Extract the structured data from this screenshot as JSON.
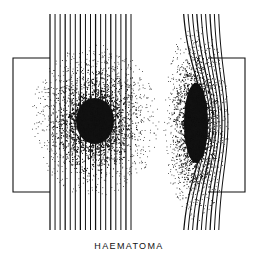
{
  "figure": {
    "caption": "HAEMATOMA",
    "background_color": "#ffffff",
    "ink_color": "#111111",
    "width": 258,
    "height": 266,
    "panels": [
      {
        "id": "left-panel",
        "name": "undisplaced-layers",
        "line_count": 17,
        "line_x_start": 50,
        "line_x_end": 131,
        "line_y_top": 14,
        "line_y_bottom": 231,
        "curvature": 0,
        "lesion": {
          "name": "haematoma-round",
          "shape": "circle",
          "center_x": 95,
          "center_y": 121,
          "core_radius_x": 19,
          "core_radius_y": 23,
          "halo_radius_x": 37,
          "halo_radius_y": 44,
          "stipple_points": 2600
        },
        "bracket": {
          "name": "left-bracket",
          "orientation": "left",
          "x_spine": 13,
          "x_arm_end": 50,
          "y_top": 58,
          "y_bottom": 192
        }
      },
      {
        "id": "right-panel",
        "name": "displaced-layers",
        "line_count": 9,
        "line_x_start": 182,
        "line_x_end": 218,
        "line_y_top": 14,
        "line_y_bottom": 231,
        "curvature": 22,
        "lesion": {
          "name": "haematoma-lens",
          "shape": "ellipse",
          "center_x": 196,
          "center_y": 123,
          "core_radius_x": 12,
          "core_radius_y": 40,
          "halo_radius_x": 19,
          "halo_radius_y": 57,
          "stipple_points": 2200
        },
        "bracket": {
          "name": "right-bracket",
          "orientation": "right",
          "x_spine": 245,
          "x_arm_end": 208,
          "y_top": 58,
          "y_bottom": 192
        }
      }
    ]
  }
}
